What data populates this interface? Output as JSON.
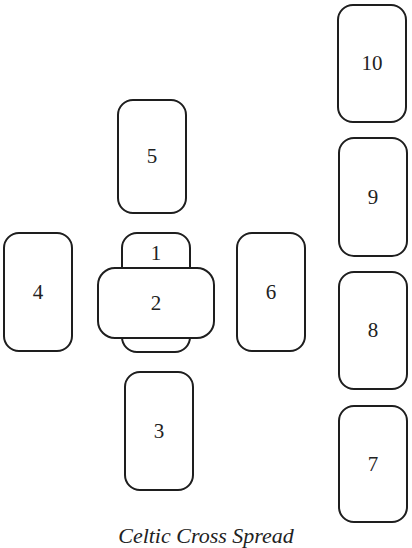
{
  "diagram": {
    "title": "Celtic Cross Spread",
    "stroke_color": "#1e1e1e",
    "background_color": "#ffffff",
    "cards": [
      {
        "position": "1",
        "orientation": "vertical",
        "x": 121,
        "y": 232,
        "w": 70,
        "h": 121
      },
      {
        "position": "2",
        "orientation": "horizontal",
        "x": 97,
        "y": 267,
        "w": 118,
        "h": 72
      },
      {
        "position": "3",
        "orientation": "vertical",
        "x": 124,
        "y": 371,
        "w": 70,
        "h": 120
      },
      {
        "position": "4",
        "orientation": "vertical",
        "x": 3,
        "y": 232,
        "w": 70,
        "h": 120
      },
      {
        "position": "5",
        "orientation": "vertical",
        "x": 117,
        "y": 99,
        "w": 70,
        "h": 115
      },
      {
        "position": "6",
        "orientation": "vertical",
        "x": 236,
        "y": 232,
        "w": 70,
        "h": 120
      },
      {
        "position": "7",
        "orientation": "vertical",
        "x": 338,
        "y": 405,
        "w": 70,
        "h": 118
      },
      {
        "position": "8",
        "orientation": "vertical",
        "x": 338,
        "y": 271,
        "w": 70,
        "h": 119
      },
      {
        "position": "9",
        "orientation": "vertical",
        "x": 338,
        "y": 137,
        "w": 70,
        "h": 120
      },
      {
        "position": "10",
        "orientation": "vertical",
        "x": 337,
        "y": 4,
        "w": 70,
        "h": 119
      }
    ]
  }
}
